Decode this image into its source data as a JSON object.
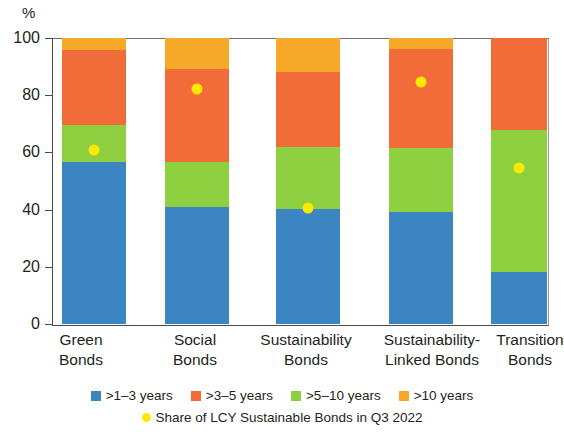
{
  "unit_label": "%",
  "y_axis": {
    "ticks": [
      0,
      20,
      40,
      60,
      80,
      100
    ],
    "min": 0,
    "max": 100
  },
  "categories": [
    "Green\nBonds",
    "Social\nBonds",
    "Sustainability\nBonds",
    "Sustainability-\nLinked Bonds",
    "Transition\nBonds"
  ],
  "legend": {
    "row1": [
      {
        "label": ">1–3 years",
        "color": "#3b85c2",
        "shape": "square"
      },
      {
        "label": ">3–5 years",
        "color": "#f26c3a",
        "shape": "square"
      },
      {
        "label": ">5–10 years",
        "color": "#8ed03f",
        "shape": "square"
      },
      {
        "label": ">10 years",
        "color": "#f6a929",
        "shape": "square"
      }
    ],
    "row2": [
      {
        "label": "Share of LCY Sustainable Bonds in Q3 2022",
        "color": "#ffe800",
        "shape": "circle"
      }
    ]
  },
  "colors": {
    "y1_3": "#3b85c2",
    "y3_5": "#f26c3a",
    "y5_10": "#8ed03f",
    "y10plus": "#f6a929",
    "marker": "#ffe800",
    "axis": "#4a4a4a",
    "text": "#231f20",
    "background": "#ffffff"
  },
  "chart_data": {
    "type": "bar",
    "stacked": true,
    "title": "",
    "xlabel": "",
    "ylabel": "%",
    "ylim": [
      0,
      100
    ],
    "yticks": [
      0,
      20,
      40,
      60,
      80,
      100
    ],
    "grid": false,
    "legend_position": "bottom",
    "categories": [
      "Green Bonds",
      "Social Bonds",
      "Sustainability Bonds",
      "Sustainability-Linked Bonds",
      "Transition Bonds"
    ],
    "series": [
      {
        "name": ">1–3 years",
        "color": "#3b85c2",
        "values": [
          56.6,
          40.9,
          40.2,
          39.2,
          18.2
        ]
      },
      {
        "name": ">3–5 years",
        "color": "#f26c3a",
        "values": [
          26.2,
          32.5,
          26.2,
          34.6,
          32.2
        ]
      },
      {
        "name": ">5–10 years",
        "color": "#8ed03f",
        "values": [
          13.0,
          15.7,
          21.7,
          22.4,
          49.6
        ]
      },
      {
        "name": ">10 years",
        "color": "#f6a929",
        "values": [
          4.2,
          10.9,
          11.9,
          3.9,
          0.0
        ]
      }
    ],
    "series_order_bottom_to_top": [
      ">1–3 years",
      ">5–10 years",
      ">3–5 years",
      ">10 years"
    ],
    "overlay": {
      "name": "Share of LCY Sustainable Bonds in Q3 2022",
      "type": "scatter",
      "color": "#ffe800",
      "values": [
        60.7,
        82.0,
        40.7,
        84.6,
        54.5
      ]
    }
  },
  "bars": [
    {
      "category": "Green Bonds",
      "left_pct": 2.0,
      "width_pct": 13.0,
      "segments": [
        {
          "name": ">1–3 years",
          "value": 56.6,
          "base": 0.0,
          "color": "#3b85c2"
        },
        {
          "name": ">5–10 years",
          "value": 13.0,
          "base": 56.6,
          "color": "#8ed03f"
        },
        {
          "name": ">3–5 years",
          "value": 26.2,
          "base": 69.6,
          "color": "#f26c3a"
        },
        {
          "name": ">10 years",
          "value": 4.2,
          "base": 95.8,
          "color": "#f6a929"
        }
      ],
      "marker": 60.7
    },
    {
      "category": "Social Bonds",
      "left_pct": 22.8,
      "width_pct": 13.0,
      "segments": [
        {
          "name": ">1–3 years",
          "value": 40.9,
          "base": 0.0,
          "color": "#3b85c2"
        },
        {
          "name": ">5–10 years",
          "value": 15.7,
          "base": 40.9,
          "color": "#8ed03f"
        },
        {
          "name": ">3–5 years",
          "value": 32.5,
          "base": 56.6,
          "color": "#f26c3a"
        },
        {
          "name": ">10 years",
          "value": 10.9,
          "base": 89.1,
          "color": "#f6a929"
        }
      ],
      "marker": 82.0
    },
    {
      "category": "Sustainability Bonds",
      "left_pct": 45.2,
      "width_pct": 13.0,
      "segments": [
        {
          "name": ">1–3 years",
          "value": 40.2,
          "base": 0.0,
          "color": "#3b85c2"
        },
        {
          "name": ">5–10 years",
          "value": 21.7,
          "base": 40.2,
          "color": "#8ed03f"
        },
        {
          "name": ">3–5 years",
          "value": 26.2,
          "base": 61.9,
          "color": "#f26c3a"
        },
        {
          "name": ">10 years",
          "value": 11.9,
          "base": 88.1,
          "color": "#f6a929"
        }
      ],
      "marker": 40.7
    },
    {
      "category": "Sustainability-Linked Bonds",
      "left_pct": 68.0,
      "width_pct": 13.0,
      "segments": [
        {
          "name": ">1–3 years",
          "value": 39.2,
          "base": 0.0,
          "color": "#3b85c2"
        },
        {
          "name": ">5–10 years",
          "value": 22.4,
          "base": 39.2,
          "color": "#8ed03f"
        },
        {
          "name": ">3–5 years",
          "value": 34.6,
          "base": 61.6,
          "color": "#f26c3a"
        },
        {
          "name": ">10 years",
          "value": 3.9,
          "base": 96.1,
          "color": "#f6a929"
        }
      ],
      "marker": 84.6
    },
    {
      "category": "Transition Bonds",
      "left_pct": 88.6,
      "width_pct": 11.4,
      "segments": [
        {
          "name": ">1–3 years",
          "value": 18.2,
          "base": 0.0,
          "color": "#3b85c2"
        },
        {
          "name": ">5–10 years",
          "value": 49.6,
          "base": 18.2,
          "color": "#8ed03f"
        },
        {
          "name": ">3–5 years",
          "value": 32.2,
          "base": 67.8,
          "color": "#f26c3a"
        }
      ],
      "marker": 54.5
    }
  ],
  "x_label_positions": [
    {
      "left": 26,
      "width": 110
    },
    {
      "left": 140,
      "width": 110
    },
    {
      "left": 238,
      "width": 136
    },
    {
      "left": 364,
      "width": 136
    },
    {
      "left": 480,
      "width": 100
    }
  ]
}
